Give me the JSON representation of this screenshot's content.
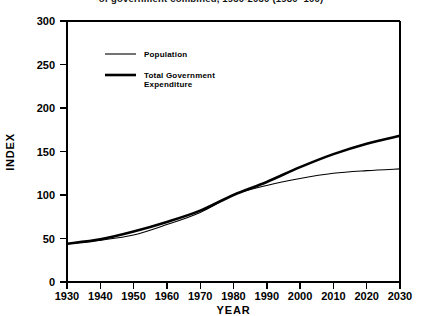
{
  "chart_data": {
    "type": "line",
    "title": "of government combined, 1930-2030 (1980=100)",
    "xlabel": "YEAR",
    "ylabel": "INDEX",
    "xlim": [
      1930,
      2030
    ],
    "ylim": [
      0,
      300
    ],
    "grid": false,
    "legend_position": "upper-left-inside",
    "xticks": [
      "1930",
      "1940",
      "1950",
      "1960",
      "1970",
      "1980",
      "1990",
      "2000",
      "2010",
      "2020",
      "2030"
    ],
    "yticks": [
      "0",
      "50",
      "100",
      "150",
      "200",
      "250",
      "300"
    ],
    "x": [
      1930,
      1940,
      1950,
      1960,
      1970,
      1980,
      1990,
      2000,
      2010,
      2020,
      2030
    ],
    "series": [
      {
        "name": "Population",
        "style": "thin",
        "values": [
          44,
          48,
          54,
          66,
          80,
          100,
          111,
          119,
          125,
          128,
          130
        ]
      },
      {
        "name": "Total Government Expenditure",
        "style": "thick",
        "values": [
          44,
          49,
          58,
          69,
          82,
          100,
          115,
          132,
          147,
          159,
          168
        ]
      }
    ]
  }
}
